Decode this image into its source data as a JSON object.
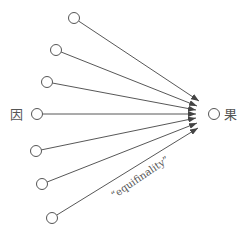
{
  "diagram": {
    "cause_label": "因",
    "effect_label": "果",
    "annotation": "“equifinality”",
    "stroke_color": "#444444",
    "sources": [
      {
        "x": 74,
        "y": 18,
        "tx": 199,
        "ty": 101
      },
      {
        "x": 56,
        "y": 50,
        "tx": 197,
        "ty": 106
      },
      {
        "x": 47,
        "y": 82,
        "tx": 196,
        "ty": 110
      },
      {
        "x": 37,
        "y": 114,
        "tx": 196,
        "ty": 114
      },
      {
        "x": 36,
        "y": 151,
        "tx": 196,
        "ty": 118
      },
      {
        "x": 42,
        "y": 184,
        "tx": 197,
        "ty": 123
      },
      {
        "x": 52,
        "y": 218,
        "tx": 198,
        "ty": 128
      }
    ],
    "target": {
      "x": 214,
      "y": 114
    }
  }
}
